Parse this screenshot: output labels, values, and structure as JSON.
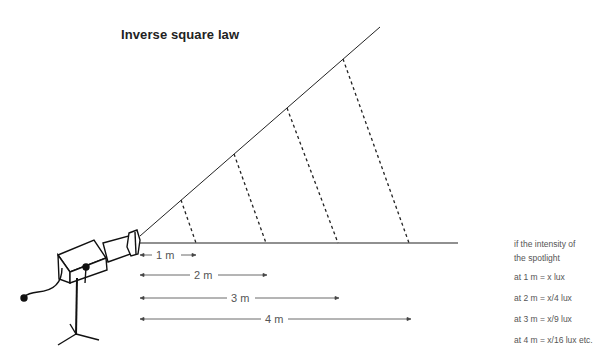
{
  "title": "Inverse square law",
  "distances": [
    {
      "label": "1 m",
      "value": 1
    },
    {
      "label": "2 m",
      "value": 2
    },
    {
      "label": "3 m",
      "value": 3
    },
    {
      "label": "4 m",
      "value": 4
    }
  ],
  "notes": {
    "line1": "if the intensity of",
    "line2": "the spotlight",
    "items": [
      "at 1 m = x lux",
      "at 2 m = x/4 lux",
      "at 3 m = x/9 lux",
      "at 4 m = x/16 lux etc."
    ]
  },
  "colors": {
    "line": "#222222",
    "text": "#555555"
  }
}
